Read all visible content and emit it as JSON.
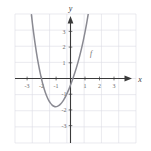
{
  "figure": {
    "name": "coordinate-plane-graph",
    "background_color": "#ffffff",
    "grid_color": "#dcdce4",
    "axis_color": "#3a3a3a",
    "curve_color": "#8a8a92",
    "label_color": "#6b6b6b"
  },
  "axis_labels": {
    "x": "x",
    "y": "y"
  },
  "curve_label": "f",
  "chart_data": {
    "type": "line",
    "title": "",
    "xlabel": "x",
    "ylabel": "y",
    "grid": true,
    "legend": "none",
    "xlim": [
      -3.5,
      3.5
    ],
    "ylim": [
      -4.5,
      3.5
    ],
    "xticks": [
      -3,
      -2,
      -1,
      1,
      2,
      3
    ],
    "xtick_labels": [
      "-3",
      "-2",
      "-1",
      "1",
      "2",
      "3"
    ],
    "yticks": [
      -4,
      -3,
      -2,
      -1,
      1,
      2,
      3
    ],
    "ytick_labels": [
      "-4",
      "-3",
      "-2",
      "-1",
      "1",
      "2",
      "3"
    ],
    "series": [
      {
        "name": "f",
        "annotation": "f",
        "local_minimum": [
          -1.5,
          -2.2
        ],
        "x": [
          -2.55,
          -2.45,
          -2.35,
          -2.25,
          -2.15,
          -2.05,
          -1.95,
          -1.85,
          -1.75,
          -1.65,
          -1.55,
          -1.45,
          -1.35,
          -1.25,
          -1.15,
          -1.05,
          -0.95,
          -0.85,
          -0.75,
          -0.65,
          -0.55,
          -0.45,
          -0.35,
          -0.25,
          -0.15,
          -0.05,
          0.05,
          0.15,
          0.25,
          0.35,
          0.45,
          0.55,
          0.65,
          0.75,
          0.85,
          0.95,
          1.05
        ],
        "y": [
          3.45,
          2.55,
          1.75,
          1.05,
          0.42,
          -0.12,
          -0.6,
          -1.01,
          -1.35,
          -1.63,
          -1.86,
          -2.03,
          -2.15,
          -2.22,
          -2.25,
          -2.23,
          -2.17,
          -2.07,
          -1.93,
          -1.76,
          -1.56,
          -1.33,
          -1.08,
          -0.8,
          -0.5,
          -0.18,
          0.16,
          0.53,
          0.93,
          1.37,
          1.85,
          2.37,
          2.95,
          3.58,
          4.27,
          5.03,
          5.86
        ]
      }
    ]
  }
}
